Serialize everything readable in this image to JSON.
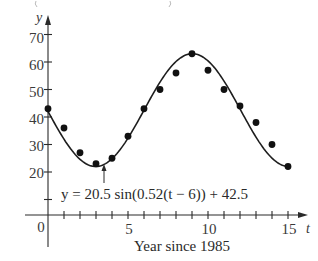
{
  "chart_data": {
    "type": "scatter",
    "title": "",
    "xlabel": "Year since 1985",
    "ylabel": "y",
    "x_axis_symbol": "t",
    "origin_label": "0",
    "xlim": [
      0,
      15
    ],
    "ylim": [
      10,
      70
    ],
    "x_ticks": [
      1,
      2,
      3,
      4,
      5,
      6,
      7,
      8,
      9,
      10,
      11,
      12,
      13,
      14,
      15
    ],
    "x_tick_labels": [
      {
        "value": 5,
        "label": "5"
      },
      {
        "value": 10,
        "label": "10"
      },
      {
        "value": 15,
        "label": "15"
      }
    ],
    "y_ticks": [
      10,
      20,
      30,
      40,
      50,
      60,
      70
    ],
    "y_tick_labels": [
      {
        "value": 20,
        "label": "20"
      },
      {
        "value": 30,
        "label": "30"
      },
      {
        "value": 40,
        "label": "40"
      },
      {
        "value": 50,
        "label": "50"
      },
      {
        "value": 60,
        "label": "60"
      },
      {
        "value": 70,
        "label": "70"
      }
    ],
    "grid": false,
    "series": [
      {
        "name": "Data",
        "kind": "scatter",
        "x": [
          0,
          1,
          2,
          3,
          4,
          5,
          6,
          7,
          8,
          9,
          10,
          11,
          12,
          13,
          14,
          15
        ],
        "values": [
          43,
          36,
          27,
          23,
          25,
          33,
          43,
          50,
          56,
          63,
          57,
          50,
          44,
          38,
          30,
          22
        ]
      },
      {
        "name": "Sinusoidal model",
        "kind": "line",
        "equation": "y = 20.5 sin(0.52(t − 6)) + 42.5",
        "amplitude": 20.5,
        "frequency": 0.52,
        "phase_shift": 6,
        "vertical_shift": 42.5
      }
    ],
    "annotations": [
      {
        "text": "y = 20.5 sin(0.52(t − 6)) + 42.5",
        "points_to": "curve near t≈3.4 (minimum)"
      }
    ]
  },
  "labels": {
    "y_axis": "y",
    "x_axis": "t",
    "origin": "0",
    "xlabel": "Year since 1985",
    "equation": "y = 20.5 sin(0.52(t − 6)) + 42.5",
    "y_tick_20": "20",
    "y_tick_30": "30",
    "y_tick_40": "40",
    "y_tick_50": "50",
    "y_tick_60": "60",
    "y_tick_70": "70",
    "x_tick_5": "5",
    "x_tick_10": "10",
    "x_tick_15": "15"
  }
}
